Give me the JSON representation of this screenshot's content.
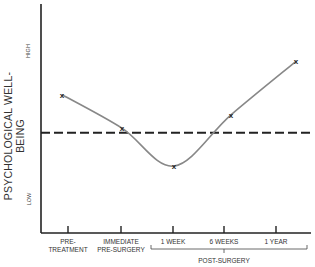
{
  "chart_data": {
    "type": "line",
    "title": "",
    "ylabel": "PSYCHOLOGICAL WELL-BEING",
    "y_tick_labels": {
      "high": "HIGH",
      "low": "LOW"
    },
    "xlabel": "",
    "categories": [
      "PRE-TREATMENT",
      "IMMEDIATE PRE-SURGERY",
      "1 WEEK",
      "6 WEEKS",
      "1 YEAR"
    ],
    "category_lines": [
      [
        "PRE-",
        "TREATMENT"
      ],
      [
        "IMMEDIATE",
        "PRE-SURGERY"
      ],
      [
        "1 WEEK"
      ],
      [
        "6 WEEKS"
      ],
      [
        "1 YEAR"
      ]
    ],
    "group_bracket": {
      "label": "POST-SURGERY",
      "covers": [
        "1 WEEK",
        "6 WEEKS",
        "1 YEAR"
      ]
    },
    "series": [
      {
        "name": "Psychological well-being",
        "marker": "x",
        "values": [
          0.62,
          0.47,
          0.3,
          0.53,
          0.77
        ]
      }
    ],
    "reference_line": {
      "style": "dashed",
      "value": 0.45
    },
    "ylim": [
      0,
      1
    ],
    "grid": false,
    "legend": "none"
  }
}
